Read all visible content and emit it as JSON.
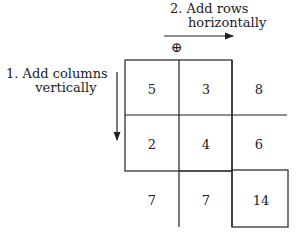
{
  "labels": {
    "step2_line1": "2. Add rows",
    "step2_line2": "horizontally",
    "step1_line1": "1. Add columns",
    "step1_line2": "vertically",
    "plus_symbol": "⊕"
  },
  "grid": {
    "rows": [
      {
        "cells": [
          "5",
          "3"
        ],
        "sum": "8"
      },
      {
        "cells": [
          "2",
          "4"
        ],
        "sum": "6"
      }
    ],
    "column_sums": [
      "7",
      "7"
    ],
    "total": "14"
  }
}
